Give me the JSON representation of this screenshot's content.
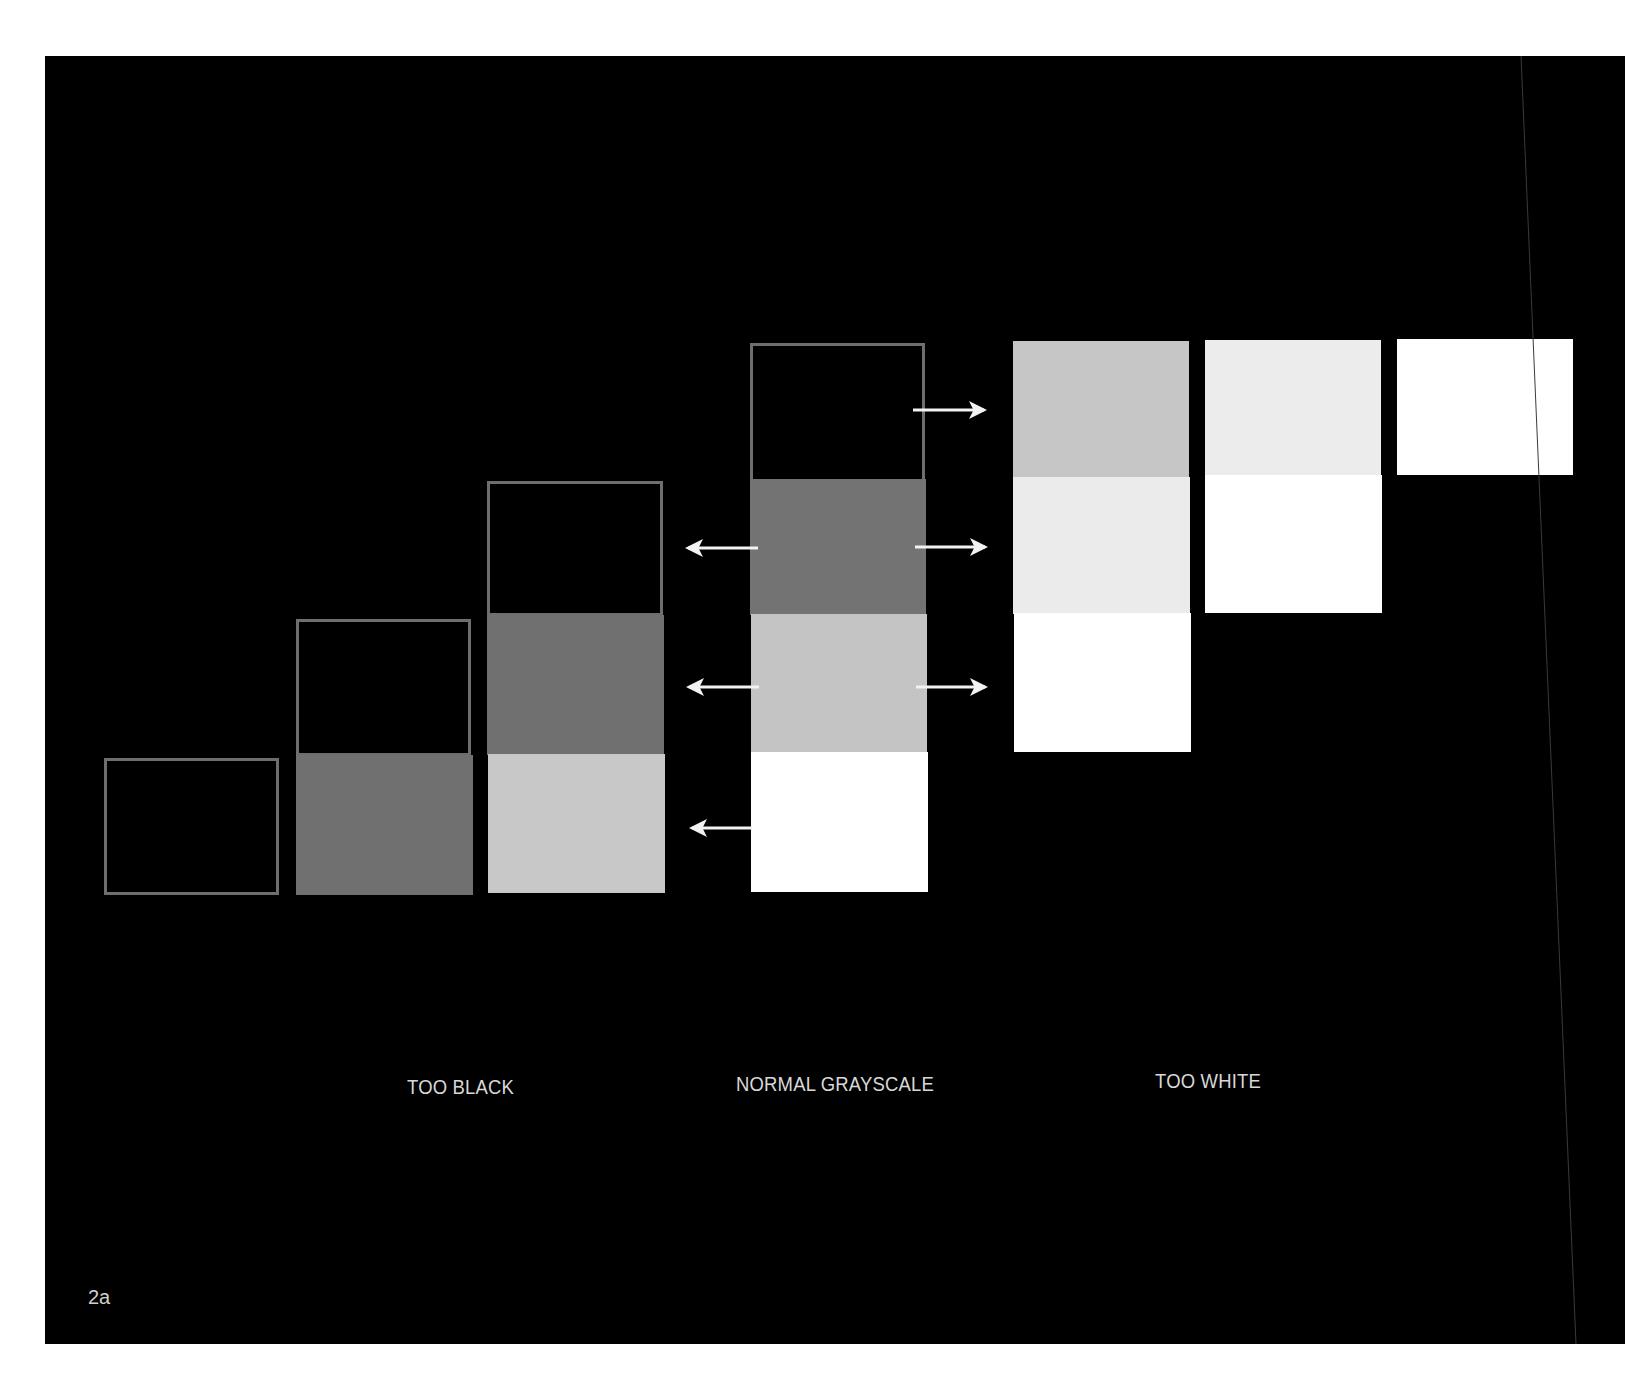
{
  "figure": {
    "page_label": "2a",
    "background": "#000000",
    "groups": [
      {
        "label": "TOO BLACK"
      },
      {
        "label": "NORMAL GRAYSCALE"
      },
      {
        "label": "TOO WHITE"
      }
    ],
    "tones": {
      "black": "#000000",
      "dark_gray": "#707070",
      "light_gray": "#c4c4c4",
      "near_white": "#ececec",
      "white": "#ffffff",
      "outline": "#6e6e6e"
    },
    "columns": [
      {
        "name": "column-1",
        "cells": [
          "black"
        ]
      },
      {
        "name": "column-2",
        "cells": [
          "black",
          "dark_gray"
        ]
      },
      {
        "name": "column-3",
        "cells": [
          "black",
          "dark_gray",
          "light_gray"
        ]
      },
      {
        "name": "column-4-normal",
        "cells": [
          "black",
          "dark_gray",
          "light_gray",
          "white"
        ]
      },
      {
        "name": "column-5",
        "cells": [
          "light_gray",
          "near_white",
          "white"
        ]
      },
      {
        "name": "column-6",
        "cells": [
          "near_white",
          "white"
        ]
      },
      {
        "name": "column-7",
        "cells": [
          "white"
        ]
      }
    ],
    "arrows": {
      "left": 3,
      "right": 3
    }
  }
}
